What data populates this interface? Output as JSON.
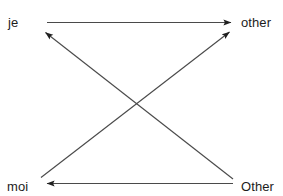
{
  "diagram": {
    "type": "crossed-arrow-mapping",
    "background_color": "#ffffff",
    "line_color": "#3d3d3d",
    "text_color": "#1c1c1c",
    "nodes": [
      {
        "id": "je",
        "label": "je",
        "position": "top-left"
      },
      {
        "id": "other",
        "label": "other",
        "position": "top-right"
      },
      {
        "id": "moi",
        "label": "moi",
        "position": "bottom-left"
      },
      {
        "id": "Other",
        "label": "Other",
        "position": "bottom-right"
      }
    ],
    "edges": [
      {
        "id": "je-to-other",
        "from": "je",
        "to": "other",
        "shape": "horizontal",
        "direction": "right"
      },
      {
        "id": "Other-to-moi",
        "from": "Other",
        "to": "moi",
        "shape": "horizontal",
        "direction": "left"
      },
      {
        "id": "moi-to-other",
        "from": "moi",
        "to": "other",
        "shape": "diagonal",
        "direction": "up-right"
      },
      {
        "id": "Other-to-je",
        "from": "Other",
        "to": "je",
        "shape": "diagonal",
        "direction": "up-left"
      }
    ]
  }
}
